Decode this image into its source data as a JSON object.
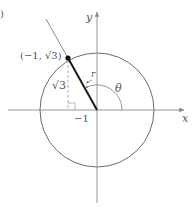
{
  "diagram": {
    "type": "unit-circle-polar-point",
    "point": {
      "x": -1,
      "y": "√3"
    },
    "labels": {
      "corner_fragment": ")",
      "y_axis": "y",
      "x_axis": "x",
      "point": "(−1, √3)",
      "vertical_leg": "√3",
      "horizontal_tick": "−1",
      "radius": "r",
      "angle": "θ"
    },
    "colors": {
      "axis": "#8a8a8a",
      "circle": "#6a6a6a",
      "radius_segment": "#1a1a1a",
      "extension_line": "#7a7a7a",
      "dashed_leg": "#9a9a9a",
      "text": "#555555",
      "point_dot": "#111111"
    }
  }
}
